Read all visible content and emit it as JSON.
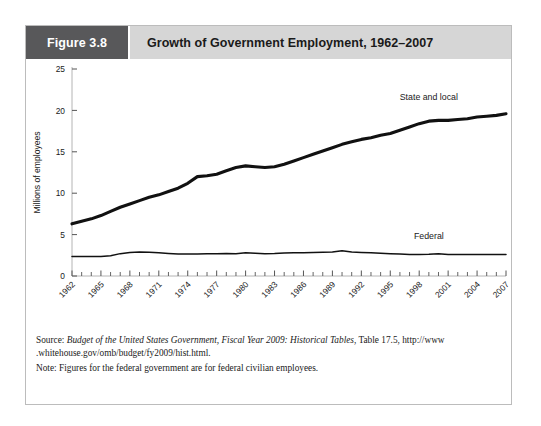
{
  "figure": {
    "number_label": "Figure 3.8",
    "title": "Growth of Government Employment, 1962–2007"
  },
  "notes": {
    "source_prefix": "Source: ",
    "source_italic": "Budget of the United States Government, Fiscal Year 2009: Historical Tables",
    "source_rest": ", Table 17.5, http://www",
    "source_line2": ".whitehouse.gov/omb/budget/fy2009/hist.html.",
    "note_line": "Note: Figures for the federal government are for federal civilian employees."
  },
  "colors": {
    "header_block": "#58585a",
    "header_title_bg": "#d6d6d6",
    "frame_border": "#bcbcbc",
    "series_state_local": "#111111",
    "series_federal": "#111111",
    "axis": "#b4b4b4",
    "text": "#1a1a1a"
  },
  "chart_data": {
    "type": "line",
    "title": "Growth of Government Employment, 1962–2007",
    "xlabel": "",
    "ylabel": "Millions of employees",
    "xlim": [
      1962,
      2007
    ],
    "ylim": [
      0,
      25
    ],
    "yticks": [
      0,
      5,
      10,
      15,
      20,
      25
    ],
    "xticks": [
      1962,
      1965,
      1968,
      1971,
      1974,
      1977,
      1980,
      1983,
      1986,
      1989,
      1992,
      1995,
      1998,
      2001,
      2004,
      2007
    ],
    "xtick_minor_step": 1,
    "xtick_label_rotation": 45,
    "grid": false,
    "legend": "inline-labels",
    "x": [
      1962,
      1963,
      1964,
      1965,
      1966,
      1967,
      1968,
      1969,
      1970,
      1971,
      1972,
      1973,
      1974,
      1975,
      1976,
      1977,
      1978,
      1979,
      1980,
      1981,
      1982,
      1983,
      1984,
      1985,
      1986,
      1987,
      1988,
      1989,
      1990,
      1991,
      1992,
      1993,
      1994,
      1995,
      1996,
      1997,
      1998,
      1999,
      2000,
      2001,
      2002,
      2003,
      2004,
      2005,
      2006,
      2007
    ],
    "series": [
      {
        "name": "State and local",
        "label": "State and local",
        "line_width": 3.1,
        "values": [
          6.3,
          6.6,
          6.9,
          7.3,
          7.8,
          8.3,
          8.7,
          9.1,
          9.5,
          9.8,
          10.2,
          10.6,
          11.2,
          12.0,
          12.1,
          12.3,
          12.7,
          13.1,
          13.3,
          13.2,
          13.1,
          13.2,
          13.5,
          13.9,
          14.3,
          14.7,
          15.1,
          15.5,
          15.9,
          16.2,
          16.5,
          16.7,
          17.0,
          17.2,
          17.6,
          18.0,
          18.4,
          18.7,
          18.8,
          18.8,
          18.9,
          19.0,
          19.2,
          19.3,
          19.4,
          19.6
        ]
      },
      {
        "name": "Federal",
        "label": "Federal",
        "line_width": 1.5,
        "values": [
          2.35,
          2.35,
          2.35,
          2.34,
          2.45,
          2.7,
          2.85,
          2.9,
          2.88,
          2.8,
          2.72,
          2.65,
          2.65,
          2.65,
          2.68,
          2.7,
          2.72,
          2.7,
          2.82,
          2.75,
          2.7,
          2.72,
          2.78,
          2.8,
          2.82,
          2.85,
          2.88,
          2.9,
          3.05,
          2.9,
          2.85,
          2.8,
          2.75,
          2.7,
          2.65,
          2.6,
          2.6,
          2.62,
          2.7,
          2.6,
          2.6,
          2.6,
          2.6,
          2.6,
          2.6,
          2.6
        ]
      }
    ],
    "annotations": [
      {
        "text": "State and local",
        "x": 1999,
        "y": 21.2
      },
      {
        "text": "Federal",
        "x": 1999,
        "y": 4.5
      }
    ]
  }
}
